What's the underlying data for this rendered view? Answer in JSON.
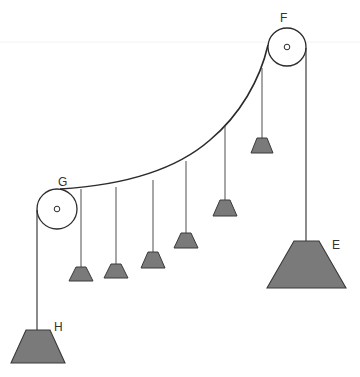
{
  "diagram": {
    "title": "",
    "type": "pulley-system-with-hanging-weights",
    "colors": {
      "line": "#2b2b2b",
      "weight_fill": "#7a7a7a",
      "weight_stroke": "#3a3a3a",
      "background": "#ffffff"
    },
    "labels": {
      "F": "F",
      "G": "G",
      "H": "H",
      "E": "E"
    },
    "pulleys": [
      {
        "id": "F",
        "cx": 287,
        "cy": 47,
        "r": 19
      },
      {
        "id": "G",
        "cx": 57,
        "cy": 209,
        "r": 20
      }
    ],
    "weights": [
      {
        "id": "H",
        "size": "large",
        "x_center": 38,
        "top_y": 330,
        "bottom_y": 363,
        "top_w": 26,
        "bottom_w": 54
      },
      {
        "id": "E",
        "size": "large",
        "x_center": 307,
        "top_y": 241,
        "bottom_y": 288,
        "top_w": 26,
        "bottom_w": 80
      },
      {
        "id": "w1",
        "size": "small",
        "x_center": 81,
        "top_y": 267,
        "bottom_y": 281,
        "top_w": 12,
        "bottom_w": 24
      },
      {
        "id": "w2",
        "size": "small",
        "x_center": 116,
        "top_y": 264,
        "bottom_y": 278,
        "top_w": 12,
        "bottom_w": 24
      },
      {
        "id": "w3",
        "size": "small",
        "x_center": 153,
        "top_y": 252,
        "bottom_y": 268,
        "top_w": 12,
        "bottom_w": 24
      },
      {
        "id": "w4",
        "size": "small",
        "x_center": 186,
        "top_y": 233,
        "bottom_y": 248,
        "top_w": 12,
        "bottom_w": 24
      },
      {
        "id": "w5",
        "size": "small",
        "x_center": 225,
        "top_y": 200,
        "bottom_y": 216,
        "top_w": 12,
        "bottom_w": 24
      },
      {
        "id": "w6",
        "size": "small",
        "x_center": 262,
        "top_y": 138,
        "bottom_y": 153,
        "top_w": 12,
        "bottom_w": 24
      }
    ]
  }
}
